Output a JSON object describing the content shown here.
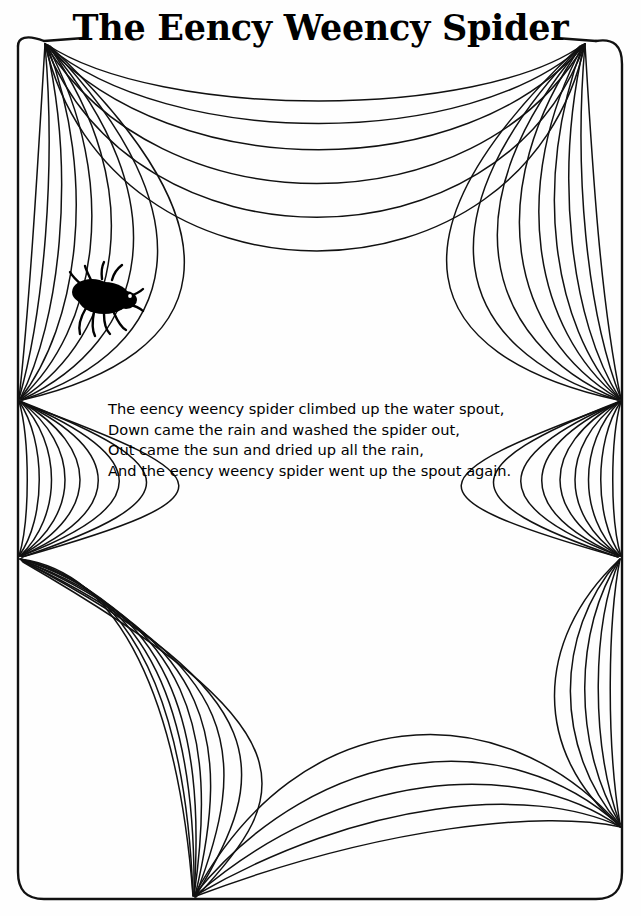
{
  "page": {
    "title": "The Eency Weency Spider",
    "background_color": "#ffffff",
    "ink_color": "#000000",
    "width": 641,
    "height": 916
  },
  "illustration": {
    "type": "spider-web-coloring-page",
    "frame": {
      "shape": "rounded-rectangle",
      "left": 17,
      "top": 40,
      "right": 622,
      "bottom": 899,
      "corner_radius": 26,
      "note": "top edge interrupted by title text"
    },
    "anchors": [
      {
        "name": "top-left-corner-anchor",
        "x": 44,
        "y": 42
      },
      {
        "name": "top-right-corner-anchor",
        "x": 586,
        "y": 42
      },
      {
        "name": "left-upper-anchor",
        "x": 18,
        "y": 400
      },
      {
        "name": "left-lower-anchor",
        "x": 18,
        "y": 557
      },
      {
        "name": "right-upper-anchor",
        "x": 621,
        "y": 400
      },
      {
        "name": "right-lower-anchor",
        "x": 621,
        "y": 557
      },
      {
        "name": "bottom-center-anchor",
        "x": 194,
        "y": 898
      },
      {
        "name": "right-bottom-anchor",
        "x": 621,
        "y": 826
      }
    ],
    "spider": {
      "x": 105,
      "y": 298,
      "facing": "right",
      "leg_count": 8,
      "color": "#000000"
    },
    "strand_count_per_fan": 9
  },
  "poem": {
    "lines": [
      "The eency weency spider climbed up the water spout,",
      "Down came the rain and washed the spider out,",
      "Out came the sun and dried up all the rain,",
      "And the eency weency spider went up the spout again."
    ]
  }
}
